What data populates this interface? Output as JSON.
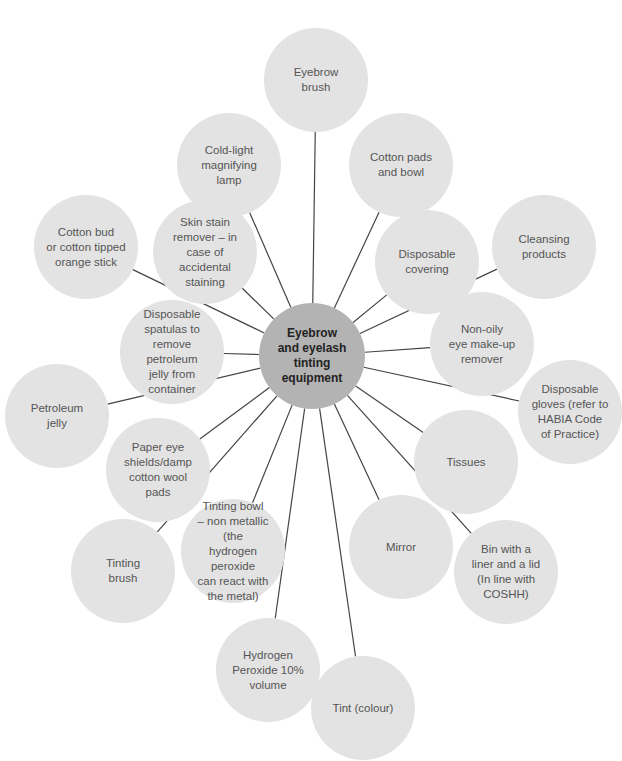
{
  "diagram": {
    "hub": {
      "label": "Eyebrow\nand eyelash\ntinting\nequipment",
      "x": 312,
      "y": 356,
      "r": 53,
      "color": "#b3b3b3"
    },
    "node_color": "#e3e3e3",
    "line_color": "#444444",
    "nodes": [
      {
        "id": "eyebrow-brush",
        "label": "Eyebrow\nbrush",
        "x": 316,
        "y": 80,
        "r": 52
      },
      {
        "id": "cold-light-lamp",
        "label": "Cold-light\nmagnifying\nlamp",
        "x": 229,
        "y": 165,
        "r": 52
      },
      {
        "id": "cotton-pads-bowl",
        "label": "Cotton pads\nand bowl",
        "x": 401,
        "y": 165,
        "r": 52
      },
      {
        "id": "cotton-bud",
        "label": "Cotton bud\nor cotton tipped\norange stick",
        "x": 86,
        "y": 247,
        "r": 52
      },
      {
        "id": "skin-stain-remover",
        "label": "Skin stain\nremover – in\ncase of accidental\nstaining",
        "x": 205,
        "y": 252,
        "r": 52
      },
      {
        "id": "disposable-covering",
        "label": "Disposable\ncovering",
        "x": 427,
        "y": 262,
        "r": 52
      },
      {
        "id": "cleansing-products",
        "label": "Cleansing\nproducts",
        "x": 544,
        "y": 247,
        "r": 52
      },
      {
        "id": "disposable-spatulas",
        "label": "Disposable\nspatulas to\nremove petroleum\njelly from\ncontainer",
        "x": 172,
        "y": 352,
        "r": 52
      },
      {
        "id": "non-oily-remover",
        "label": "Non-oily\neye make-up\nremover",
        "x": 482,
        "y": 344,
        "r": 52
      },
      {
        "id": "petroleum-jelly",
        "label": "Petroleum\njelly",
        "x": 57,
        "y": 416,
        "r": 52
      },
      {
        "id": "disposable-gloves",
        "label": "Disposable\ngloves (refer to\nHABIA Code\nof Practice)",
        "x": 570,
        "y": 412,
        "r": 52
      },
      {
        "id": "paper-eye-shields",
        "label": "Paper eye\nshields/damp\ncotton wool\npads",
        "x": 158,
        "y": 470,
        "r": 52
      },
      {
        "id": "tissues",
        "label": "Tissues",
        "x": 466,
        "y": 462,
        "r": 52
      },
      {
        "id": "tinting-brush",
        "label": "Tinting\nbrush",
        "x": 123,
        "y": 571,
        "r": 52
      },
      {
        "id": "tinting-bowl",
        "label": "Tinting bowl\n– non metallic (the\nhydrogen peroxide\ncan react with\nthe metal)",
        "x": 233,
        "y": 551,
        "r": 52
      },
      {
        "id": "mirror",
        "label": "Mirror",
        "x": 401,
        "y": 547,
        "r": 52
      },
      {
        "id": "bin",
        "label": "Bin with a\nliner and a lid\n(In line with\nCOSHH)",
        "x": 506,
        "y": 572,
        "r": 52
      },
      {
        "id": "hydrogen-peroxide",
        "label": "Hydrogen\nPeroxide 10%\nvolume",
        "x": 268,
        "y": 670,
        "r": 52
      },
      {
        "id": "tint-colour",
        "label": "Tint (colour)",
        "x": 363,
        "y": 708,
        "r": 52
      }
    ]
  }
}
